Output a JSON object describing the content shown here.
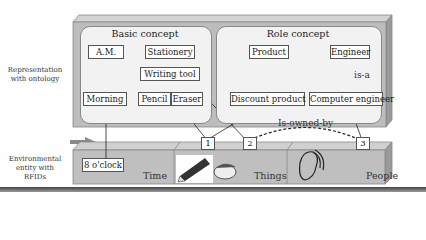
{
  "side_labels": {
    "ontology": [
      "Representation",
      "with ontology"
    ],
    "environment": [
      "Environmental",
      "entity with",
      "RFIDs"
    ]
  },
  "basic_concept": {
    "title": "Basic concept",
    "nodes": {
      "am": "A.M.",
      "stationery": "Stationery",
      "writing_tool": "Writing tool",
      "morning": "Morning",
      "pencil": "Pencil",
      "eraser": "Eraser"
    }
  },
  "role_concept": {
    "title": "Role concept",
    "nodes": {
      "product": "Product",
      "engineer": "Engineer",
      "discount_product": "Discount product",
      "computer_engineer": "Computer engineer"
    },
    "relation_label": "is-a"
  },
  "relation": "Is-owned-by",
  "environment": {
    "time_value": "8 o'clock",
    "sections": [
      "Time",
      "Things",
      "People"
    ],
    "tags": [
      "1",
      "2",
      "3"
    ]
  },
  "colors": {
    "slab_top": "#c8c8c8",
    "slab_front": "#a9a9a9",
    "panel": "#f2f2f2",
    "arrow": "#8a8a8a"
  }
}
